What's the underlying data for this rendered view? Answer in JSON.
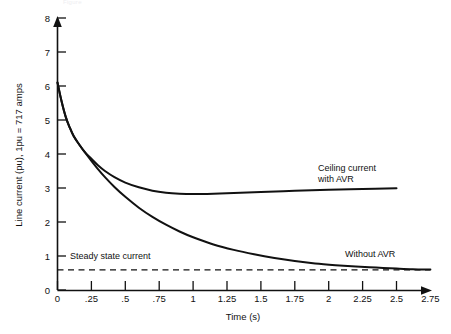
{
  "chart_data": {
    "type": "line",
    "title": "",
    "xlabel": "Time (s)",
    "ylabel": "Line current (pu), 1pu = 717 amps",
    "xlim": [
      0,
      2.75
    ],
    "ylim": [
      0,
      8
    ],
    "grid": false,
    "legend_position": "inline-annotations",
    "xticks": [
      0,
      0.25,
      0.5,
      0.75,
      1,
      1.25,
      1.5,
      1.75,
      2,
      2.25,
      2.5,
      2.75
    ],
    "xticklabels": [
      "0",
      ".25",
      ".5",
      ".75",
      "1",
      "1.25",
      "1.5",
      "1.75",
      "2",
      "2.25",
      "2.5",
      "2.75"
    ],
    "yticks": [
      0,
      1,
      2,
      3,
      4,
      5,
      6,
      7,
      8
    ],
    "yticklabels": [
      "0",
      "1",
      "2",
      "3",
      "4",
      "5",
      "6",
      "7",
      "8"
    ],
    "series": [
      {
        "name": "Ceiling current with AVR",
        "style": "solid",
        "color": "#111111",
        "points": [
          [
            0.0,
            6.1
          ],
          [
            0.03,
            5.55
          ],
          [
            0.06,
            5.1
          ],
          [
            0.09,
            4.78
          ],
          [
            0.12,
            4.52
          ],
          [
            0.16,
            4.28
          ],
          [
            0.2,
            4.06
          ],
          [
            0.25,
            3.86
          ],
          [
            0.3,
            3.66
          ],
          [
            0.35,
            3.5
          ],
          [
            0.42,
            3.32
          ],
          [
            0.5,
            3.16
          ],
          [
            0.6,
            3.02
          ],
          [
            0.7,
            2.92
          ],
          [
            0.8,
            2.86
          ],
          [
            0.9,
            2.83
          ],
          [
            1.0,
            2.82
          ],
          [
            1.15,
            2.83
          ],
          [
            1.3,
            2.85
          ],
          [
            1.5,
            2.88
          ],
          [
            1.75,
            2.92
          ],
          [
            2.0,
            2.95
          ],
          [
            2.25,
            2.97
          ],
          [
            2.5,
            2.99
          ]
        ]
      },
      {
        "name": "Without AVR",
        "style": "solid",
        "color": "#111111",
        "points": [
          [
            0.0,
            6.1
          ],
          [
            0.03,
            5.55
          ],
          [
            0.06,
            5.1
          ],
          [
            0.09,
            4.78
          ],
          [
            0.12,
            4.52
          ],
          [
            0.16,
            4.28
          ],
          [
            0.2,
            4.06
          ],
          [
            0.25,
            3.8
          ],
          [
            0.3,
            3.55
          ],
          [
            0.35,
            3.32
          ],
          [
            0.42,
            3.03
          ],
          [
            0.5,
            2.74
          ],
          [
            0.6,
            2.42
          ],
          [
            0.7,
            2.15
          ],
          [
            0.8,
            1.92
          ],
          [
            0.9,
            1.72
          ],
          [
            1.0,
            1.55
          ],
          [
            1.15,
            1.34
          ],
          [
            1.3,
            1.18
          ],
          [
            1.45,
            1.05
          ],
          [
            1.6,
            0.94
          ],
          [
            1.75,
            0.85
          ],
          [
            1.9,
            0.78
          ],
          [
            2.05,
            0.73
          ],
          [
            2.2,
            0.69
          ],
          [
            2.35,
            0.66
          ],
          [
            2.5,
            0.63
          ],
          [
            2.62,
            0.61
          ],
          [
            2.75,
            0.6
          ]
        ]
      },
      {
        "name": "Steady state current",
        "style": "dashed",
        "color": "#111111",
        "value": 0.59,
        "points": [
          [
            0.0,
            0.59
          ],
          [
            2.75,
            0.59
          ]
        ]
      }
    ],
    "annotations": [
      {
        "id": "ceiling",
        "text_lines": [
          "Ceiling current",
          "with AVR"
        ],
        "x": 1.93,
        "y": 4.35
      },
      {
        "id": "without",
        "text_lines": [
          "Without AVR"
        ],
        "x": 2.12,
        "y": 1.02
      },
      {
        "id": "steady",
        "text_lines": [
          "Steady state current"
        ],
        "x": 0.09,
        "y": 1.0
      }
    ]
  },
  "axis": {
    "x_title": "Time (s)",
    "y_title": "Line current (pu), 1pu = 717 amps",
    "origin_label": "0"
  },
  "annotations": {
    "ceiling_line1": "Ceiling current",
    "ceiling_line2": "with AVR",
    "without_avr": "Without AVR",
    "steady_state": "Steady state current"
  },
  "colors": {
    "ink": "#111111",
    "background": "#ffffff"
  },
  "faint_caption": "Figure"
}
